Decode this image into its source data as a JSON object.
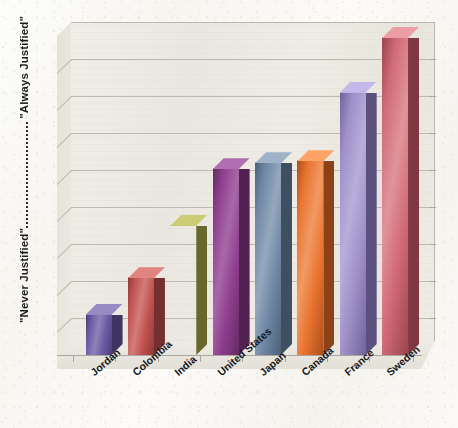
{
  "chart_data": {
    "type": "bar",
    "title": "",
    "subtitle": "",
    "xlabel": "",
    "ylabel": "",
    "categories": [
      "Jordan",
      "Colombia",
      "India",
      "United States",
      "Japan",
      "Canada",
      "France",
      "Sweden"
    ],
    "values": [
      1.0,
      1.9,
      3.2,
      4.6,
      4.75,
      4.8,
      6.5,
      7.85
    ],
    "series": [
      {
        "name": "Justifiability rating",
        "values": [
          1.0,
          1.9,
          3.2,
          4.6,
          4.75,
          4.8,
          6.5,
          7.85
        ]
      }
    ],
    "bar_colors": [
      "#6b5b9e",
      "#c0504d",
      "#a5a council",
      "#8e3f8e",
      "#6d86a3",
      "#e8712e",
      "#9e8fc6",
      "#cf6471"
    ],
    "ylim": [
      0,
      8
    ],
    "yticks": [
      0,
      1,
      2,
      3,
      4,
      5,
      6,
      7,
      8
    ],
    "ytick_labels": [
      "",
      "",
      "",
      "",
      "",
      "",
      "",
      "",
      ""
    ],
    "y_axis_low_label": "\"Never Justified\"",
    "y_axis_high_label": "\"Always Justified\"",
    "gridlines": 8,
    "grid": true,
    "legend": false,
    "legend_position": "none",
    "style": "3d-column",
    "background": "#f5f3ee"
  },
  "axis": {
    "y_high_label": "\"Always Justified\"",
    "y_low_label": "\"Never Justified\""
  },
  "bars": [
    {
      "label": "Jordan",
      "value": 1.0,
      "face": "#6d5ba2",
      "side": "#4b3f78",
      "top": "#8f82ba"
    },
    {
      "label": "Colombia",
      "value": 1.9,
      "face": "#c1524f",
      "side": "#8e3a39",
      "top": "#d27d79"
    },
    {
      "label": "India",
      "value": 3.2,
      "face": "#a9a martial",
      "side": "#7f7f38",
      "top": "#c0c06e"
    },
    {
      "label": "United States",
      "value": 4.6,
      "face": "#8e3f8e",
      "side": "#642a64",
      "top": "#a868a8"
    },
    {
      "label": "Japan",
      "value": 4.75,
      "face": "#6f87a4",
      "side": "#4d6077",
      "top": "#95a8bd"
    },
    {
      "label": "Canada",
      "value": 4.8,
      "face": "#e8732f",
      "side": "#ab4f1c",
      "top": "#f19a63"
    },
    {
      "label": "France",
      "value": 6.5,
      "face": "#9e8fc8",
      "side": "#70629b",
      "top": "#b9aedb"
    },
    {
      "label": "Sweden",
      "value": 7.85,
      "face": "#d06a76",
      "side": "#9b4450",
      "top": "#e0949c"
    }
  ]
}
